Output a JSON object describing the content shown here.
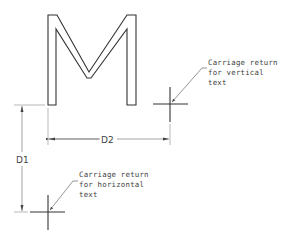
{
  "diagram": {
    "glyph": "M",
    "callouts": {
      "vertical": {
        "lines": [
          "Carriage return",
          "for vertical",
          "text"
        ]
      },
      "horizontal": {
        "lines": [
          "Carriage return",
          "for horizontal",
          "text"
        ]
      }
    },
    "dimensions": {
      "d1": "D1",
      "d2": "D2"
    },
    "colors": {
      "stroke": "#333333",
      "light": "#888888",
      "background": "#ffffff"
    }
  }
}
